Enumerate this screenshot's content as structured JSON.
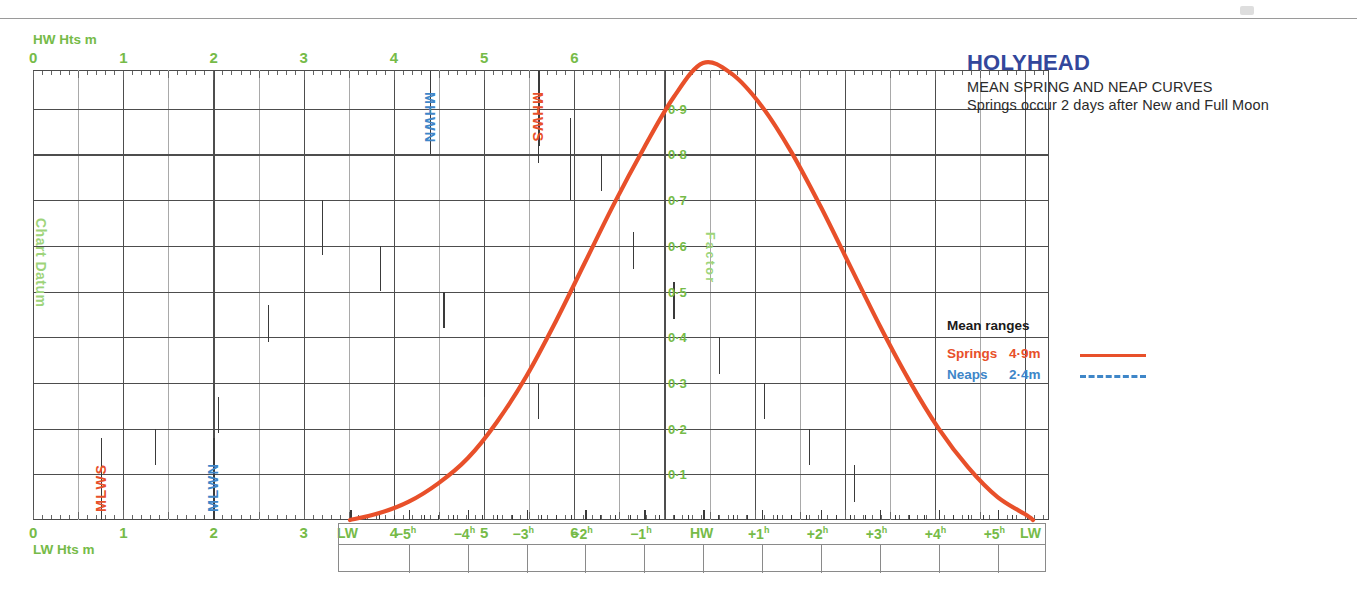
{
  "title": {
    "port": "HOLYHEAD",
    "subtitle": "MEAN SPRING AND NEAP CURVES",
    "note": "Springs occur 2 days after New and Full Moon"
  },
  "legend": {
    "heading": "Mean ranges",
    "rows": [
      {
        "name": "Springs",
        "value": "4·9m",
        "style": "solid",
        "color": "#e8502a"
      },
      {
        "name": "Neaps",
        "value": "2·4m",
        "style": "dashed",
        "color": "#3e86c8"
      }
    ]
  },
  "axes": {
    "top_caption": "HW Hts m",
    "bottom_caption": "LW Hts m",
    "height_ticks": [
      "0",
      "1",
      "2",
      "3",
      "4",
      "5",
      "6"
    ],
    "factor_caption": "Factor",
    "factor_ticks": [
      "0·1",
      "0·2",
      "0·3",
      "0·4",
      "0·5",
      "0·6",
      "0·7",
      "0·8",
      "0·9"
    ],
    "datum_label": "Chart Datum",
    "time_ticks": [
      "LW",
      "−5",
      "−4",
      "−3",
      "−2",
      "−1",
      "HW",
      "+1",
      "+2",
      "+3",
      "+4",
      "+5",
      "LW"
    ],
    "time_unit": "h"
  },
  "tide_levels": [
    {
      "label": "MHWN",
      "value": 4.4,
      "color": "#3e86c8",
      "axis": "top"
    },
    {
      "label": "MHWS",
      "value": 5.6,
      "color": "#e8502a",
      "axis": "top"
    },
    {
      "label": "MLWS",
      "value": 0.75,
      "color": "#e8502a",
      "axis": "bottom"
    },
    {
      "label": "MLWN",
      "value": 2.0,
      "color": "#3e86c8",
      "axis": "bottom"
    }
  ],
  "colors": {
    "springs": "#e8502a",
    "neaps": "#3e86c8",
    "axis_green": "#76bb48",
    "datum_green": "#9ed47a",
    "title_blue": "#33479b",
    "grid": "#4d4d4d",
    "grid_minor": "#a9a9a9"
  },
  "chart_data": {
    "type": "line",
    "xlabel": "Hours relative to High Water",
    "ylabel": "Factor",
    "xlim": [
      -6.0,
      5.6
    ],
    "ylim": [
      0,
      1.0
    ],
    "grid": true,
    "legend_position": "right",
    "x": [
      -6.0,
      -5.5,
      -5.0,
      -4.5,
      -4.0,
      -3.5,
      -3.0,
      -2.5,
      -2.0,
      -1.5,
      -1.0,
      -0.5,
      0.0,
      0.5,
      1.0,
      1.5,
      2.0,
      2.5,
      3.0,
      3.5,
      4.0,
      4.5,
      5.0,
      5.5,
      5.6
    ],
    "series": [
      {
        "name": "Springs",
        "range_m": 4.9,
        "style": "solid",
        "color": "#e8502a",
        "values": [
          0.0,
          0.015,
          0.04,
          0.08,
          0.135,
          0.215,
          0.315,
          0.435,
          0.565,
          0.695,
          0.815,
          0.925,
          1.0,
          0.975,
          0.905,
          0.805,
          0.685,
          0.555,
          0.425,
          0.305,
          0.2,
          0.115,
          0.05,
          0.01,
          0.0
        ]
      },
      {
        "name": "Neaps",
        "range_m": 2.4,
        "style": "dashed",
        "color": "#3e86c8",
        "values": [
          0.0,
          0.015,
          0.04,
          0.08,
          0.135,
          0.215,
          0.315,
          0.435,
          0.565,
          0.695,
          0.815,
          0.925,
          1.0,
          0.975,
          0.905,
          0.805,
          0.685,
          0.555,
          0.425,
          0.305,
          0.2,
          0.115,
          0.05,
          0.01,
          0.0
        ]
      }
    ],
    "height_axis": {
      "top_label": "HW Hts m",
      "bottom_label": "LW Hts m",
      "range_m": [
        0,
        6.5
      ],
      "major_step_m": 1,
      "minor_step_m": 0.5
    },
    "annotations": [
      {
        "label": "MHWS",
        "axis": "HW Hts m",
        "value_m": 5.6
      },
      {
        "label": "MHWN",
        "axis": "HW Hts m",
        "value_m": 4.4
      },
      {
        "label": "MLWN",
        "axis": "LW Hts m",
        "value_m": 2.0
      },
      {
        "label": "MLWS",
        "axis": "LW Hts m",
        "value_m": 0.75
      },
      {
        "label": "Chart Datum",
        "axis": "LW Hts m",
        "value_m": 0.0
      }
    ]
  }
}
